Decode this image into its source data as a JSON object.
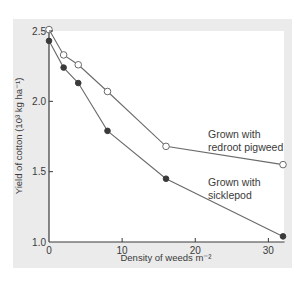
{
  "chart_data": {
    "type": "line",
    "title": "",
    "xlabel": "Density of weeds m⁻²",
    "ylabel": "Yield of cotton (10³ kg ha⁻¹)",
    "xlim": [
      0,
      32
    ],
    "ylim": [
      1.0,
      2.5
    ],
    "xticks": [
      0,
      10,
      20,
      30
    ],
    "xtick_labels": [
      "0",
      "10",
      "20",
      "30"
    ],
    "yticks": [
      1.0,
      1.5,
      2.0,
      2.5
    ],
    "ytick_labels": [
      "1.0",
      "1.5",
      "2.0",
      "2.5"
    ],
    "grid": false,
    "legend": "inline annotations",
    "series": [
      {
        "name": "Grown with redroot pigweed",
        "marker": "open-circle",
        "x": [
          0,
          2,
          4,
          8,
          16,
          32
        ],
        "y": [
          2.51,
          2.33,
          2.26,
          2.07,
          1.68,
          1.55
        ]
      },
      {
        "name": "Grown with sicklepod",
        "marker": "filled-circle",
        "x": [
          0,
          2,
          4,
          8,
          16,
          32
        ],
        "y": [
          2.43,
          2.24,
          2.13,
          1.79,
          1.45,
          1.04
        ]
      }
    ],
    "annotations": [
      {
        "lines": [
          "Grown with",
          "redroot pigweed"
        ],
        "series": 0
      },
      {
        "lines": [
          "Grown with",
          "sicklepod"
        ],
        "series": 1
      }
    ]
  },
  "colors": {
    "panel_bg": "#ebebeb",
    "plot_bg": "#ffffff",
    "axis": "#3a3a3a",
    "line": "#6a6a6a",
    "marker_fill_dark": "#3a3a3a"
  }
}
